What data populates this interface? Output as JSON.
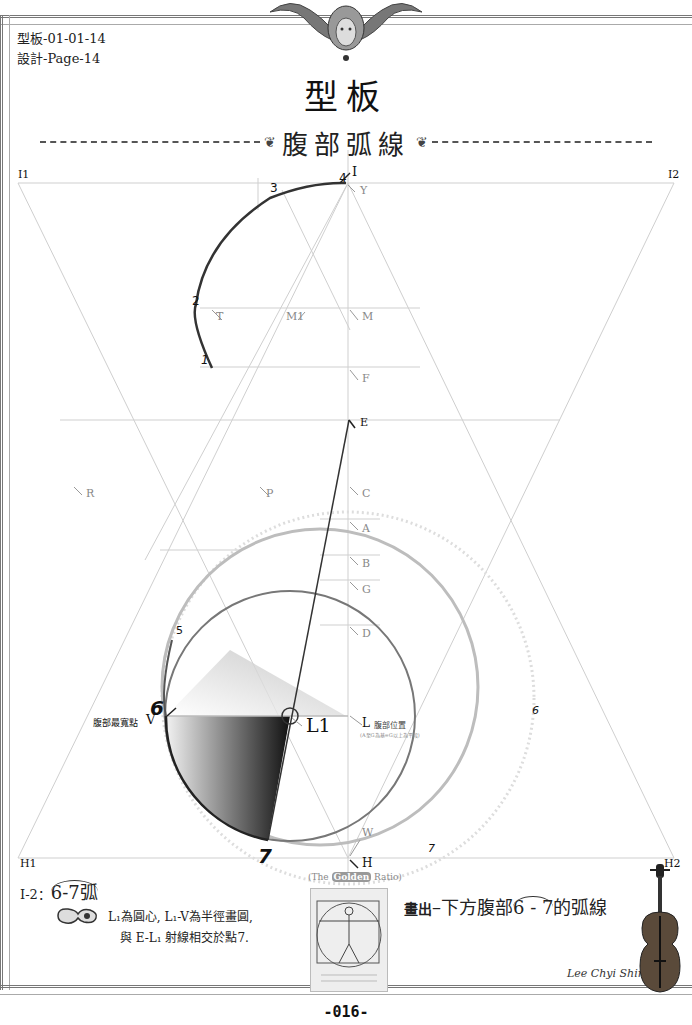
{
  "header": {
    "code_line1": "型板-01-01-14",
    "code_line2": "設計-Page-14",
    "ornament_icon": "baroque-face-ornament-icon",
    "main_title": "型板"
  },
  "section": {
    "flourish_left": "❦",
    "title": "腹部弧線",
    "flourish_right": "❦"
  },
  "diagram": {
    "points": {
      "I1": "I1",
      "I2": "I2",
      "I": "I",
      "Y": "Y",
      "T": "T",
      "M1": "M1",
      "M": "M",
      "F": "F",
      "E": "E",
      "R": "R",
      "P": "P",
      "C": "C",
      "A": "A",
      "B": "B",
      "G": "G",
      "D": "D",
      "V": "V",
      "L1": "L1",
      "L": "L",
      "W": "W",
      "H": "H",
      "H1": "H1",
      "H2": "H2"
    },
    "numbers": {
      "n1": "1",
      "n2": "2",
      "n3": "3",
      "n4": "4",
      "n5": "5",
      "n6": "6",
      "n7": "7",
      "n6_right": "6",
      "n7_right": "7"
    },
    "labels": {
      "widest_point": "腹部最寬點",
      "belly_position": "腹部位置",
      "belly_position_note": "(A至G為基=G以上為平段)",
      "v_sub": "Svg6-1",
      "l1_sub": "Svg6-2",
      "e_sub": "Svg3"
    },
    "colors": {
      "construction_line": "#c8c8c8",
      "curve": "#333333",
      "circle_large": "#bdbdbd",
      "circle_small": "#555555"
    }
  },
  "footer": {
    "step_label": "I-2：",
    "step_arc": "6-7弧",
    "pointer_icon": "hand-pointer-icon",
    "instruction_line1": "L₁為圓心, L₁-V為半徑畫圓,",
    "instruction_line2": "與 E-L₁ 射線相交於點7.",
    "golden_caption_pre": "(The ",
    "golden_caption_mid": "Golden",
    "golden_caption_post": " Ratio)",
    "vitruvian_icon": "vitruvian-man-image",
    "draw_prefix": "畫出",
    "draw_dash": "–",
    "draw_text": "下方腹部",
    "draw_arc": "6 - 7",
    "draw_suffix": "的弧線",
    "signature": "Lee Chyi Shing",
    "violin_icon": "violin-image",
    "page_number": "-016-"
  }
}
